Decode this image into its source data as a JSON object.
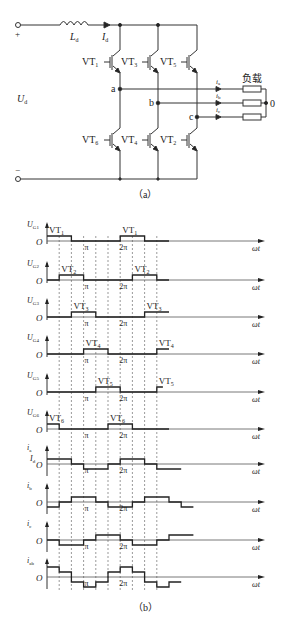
{
  "circuit": {
    "caption": "（a）",
    "terminal_plus": "+",
    "terminal_minus": "−",
    "inductor_label": {
      "main": "L",
      "sub": "d"
    },
    "dc_current_label": {
      "main": "I",
      "sub": "d"
    },
    "dc_voltage_label": {
      "main": "U",
      "sub": "d"
    },
    "load_label": "负载",
    "neutral_label": "0",
    "nodes": [
      "a",
      "b",
      "c"
    ],
    "switches_upper": [
      {
        "main": "VT",
        "sub": "1"
      },
      {
        "main": "VT",
        "sub": "3"
      },
      {
        "main": "VT",
        "sub": "5"
      }
    ],
    "switches_lower": [
      {
        "main": "VT",
        "sub": "6"
      },
      {
        "main": "VT",
        "sub": "4"
      },
      {
        "main": "VT",
        "sub": "2"
      }
    ],
    "phase_currents": [
      {
        "main": "i",
        "sub": "a"
      },
      {
        "main": "i",
        "sub": "b"
      },
      {
        "main": "i",
        "sub": "c"
      }
    ]
  },
  "waveforms": {
    "caption": "（b）",
    "x_axis_label": "ωt",
    "origin_label": "O",
    "pi_label": "π",
    "two_pi_label": "2π",
    "dc_level_label": {
      "main": "I",
      "sub": "d"
    }
  },
  "chart_data": {
    "type": "line",
    "xlabel": "ωt",
    "x_unit": "π/3 (60° step)",
    "x_ticks": [
      "O",
      "π",
      "2π"
    ],
    "x_range_steps": [
      0,
      10
    ],
    "series": [
      {
        "name": "U_G1",
        "label": {
          "main": "U",
          "sub": "G1"
        },
        "pulse": "VT1",
        "pulse_label": {
          "main": "VT",
          "sub": "1"
        },
        "steps": [
          1,
          1,
          0,
          0,
          0,
          0,
          1,
          1,
          0,
          0
        ]
      },
      {
        "name": "U_G2",
        "label": {
          "main": "U",
          "sub": "G2"
        },
        "pulse": "VT2",
        "pulse_label": {
          "main": "VT",
          "sub": "2"
        },
        "steps": [
          0,
          1,
          1,
          0,
          0,
          0,
          0,
          1,
          1,
          0
        ]
      },
      {
        "name": "U_G3",
        "label": {
          "main": "U",
          "sub": "G3"
        },
        "pulse": "VT3",
        "pulse_label": {
          "main": "VT",
          "sub": "3"
        },
        "steps": [
          0,
          0,
          1,
          1,
          0,
          0,
          0,
          0,
          1,
          1
        ]
      },
      {
        "name": "U_G4",
        "label": {
          "main": "U",
          "sub": "G4"
        },
        "pulse": "VT4",
        "pulse_label": {
          "main": "VT",
          "sub": "4"
        },
        "steps": [
          0,
          0,
          0,
          1,
          1,
          0,
          0,
          0,
          0,
          1
        ]
      },
      {
        "name": "U_G5",
        "label": {
          "main": "U",
          "sub": "G5"
        },
        "pulse": "VT5",
        "pulse_label": {
          "main": "VT",
          "sub": "5"
        },
        "steps": [
          0,
          0,
          0,
          0,
          1,
          1,
          0,
          0,
          0,
          0.5
        ]
      },
      {
        "name": "U_G6",
        "label": {
          "main": "U",
          "sub": "G6"
        },
        "pulse": "VT6",
        "pulse_label": {
          "main": "VT",
          "sub": "6"
        },
        "steps": [
          1,
          0,
          0,
          0,
          0,
          1,
          1,
          0,
          0,
          0
        ]
      },
      {
        "name": "i_a",
        "label": {
          "main": "i",
          "sub": "a"
        },
        "amplitude": "I_d",
        "steps": [
          1,
          1,
          0,
          -1,
          -1,
          0,
          1,
          1,
          0,
          -1,
          -1
        ]
      },
      {
        "name": "i_b",
        "label": {
          "main": "i",
          "sub": "b"
        },
        "amplitude": "I_d",
        "steps": [
          -1,
          0,
          1,
          1,
          0,
          -1,
          -1,
          0,
          1,
          1,
          0,
          -1
        ]
      },
      {
        "name": "i_c",
        "label": {
          "main": "i",
          "sub": "c"
        },
        "amplitude": "I_d",
        "steps": [
          0,
          -1,
          -1,
          0,
          1,
          1,
          0,
          -1,
          -1,
          0,
          1,
          1
        ]
      },
      {
        "name": "i_ab",
        "label": {
          "main": "i",
          "sub": "ab"
        },
        "amplitude": "I_d",
        "steps": [
          2,
          1,
          -1,
          -2,
          -1,
          1,
          2,
          1,
          -1,
          -2,
          -1
        ]
      }
    ]
  }
}
